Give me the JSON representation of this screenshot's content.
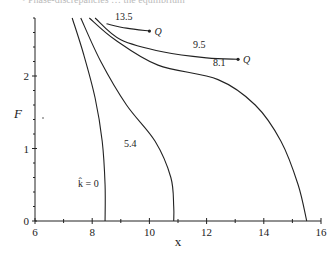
{
  "caption_fragment": "• Phase-discrepancies … the equilibrium",
  "chart_data": {
    "type": "line",
    "title": "",
    "xlabel": "x",
    "ylabel": "F",
    "xlim": [
      6,
      16
    ],
    "ylim": [
      0,
      2.8
    ],
    "xticks": [
      6,
      8,
      10,
      12,
      14,
      16
    ],
    "yticks_labeled": [
      0,
      1,
      2
    ],
    "ytick_minor_step": 0.2,
    "grid": false,
    "legend": "none (curves labeled inline)",
    "series": [
      {
        "name": "k̂ = 0",
        "label": "k̂ = 0",
        "points": [
          [
            7.3,
            2.8
          ],
          [
            7.7,
            2.3
          ],
          [
            8.1,
            1.7
          ],
          [
            8.35,
            1.1
          ],
          [
            8.45,
            0.5
          ],
          [
            8.45,
            0
          ]
        ]
      },
      {
        "name": "5.4",
        "label": "5.4",
        "points": [
          [
            7.6,
            2.8
          ],
          [
            8.3,
            2.2
          ],
          [
            9.2,
            1.6
          ],
          [
            10.2,
            1.1
          ],
          [
            10.75,
            0.6
          ],
          [
            10.85,
            0.2
          ],
          [
            10.85,
            0
          ]
        ]
      },
      {
        "name": "8.1",
        "label": "8.1",
        "points": [
          [
            7.9,
            2.8
          ],
          [
            8.8,
            2.5
          ],
          [
            10.3,
            2.15
          ],
          [
            12.4,
            1.95
          ],
          [
            13.7,
            1.6
          ],
          [
            14.6,
            1.1
          ],
          [
            15.2,
            0.5
          ],
          [
            15.5,
            0
          ]
        ]
      },
      {
        "name": "9.5",
        "label": "9.5",
        "end_label": "Q",
        "points": [
          [
            8.1,
            2.8
          ],
          [
            9.0,
            2.5
          ],
          [
            10.5,
            2.33
          ],
          [
            12.0,
            2.25
          ],
          [
            13.1,
            2.23
          ]
        ]
      },
      {
        "name": "13.5",
        "label": "13.5",
        "end_label": "Q",
        "points": [
          [
            8.5,
            2.72
          ],
          [
            9.2,
            2.66
          ],
          [
            10.0,
            2.62
          ]
        ]
      }
    ],
    "annotations": [
      "13.5",
      "9.5",
      "8.1",
      "5.4",
      "k̂ = 0",
      "Q",
      "Q"
    ]
  }
}
